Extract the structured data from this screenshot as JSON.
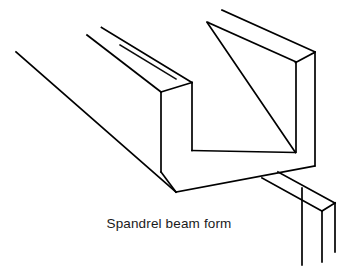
{
  "figure": {
    "title": "Spandrel beam form",
    "caption": "Spandrel beam form",
    "kind": "isometric line drawing",
    "stroke_color": "#000000",
    "background_color": "#ffffff",
    "width": 338,
    "height": 276
  },
  "drawing": {
    "description": "Isometric pictorial of a U-shaped spandrel beam formwork with a bottom ledger strip and a vertical support leg",
    "parts": [
      {
        "id": "outer-back-wall",
        "label": "outer back wall panel"
      },
      {
        "id": "inner-back-wall",
        "label": "inner back wall panel"
      },
      {
        "id": "soffit",
        "label": "soffit / bottom panel"
      },
      {
        "id": "front-wall",
        "label": "front wall panel"
      },
      {
        "id": "end-face",
        "label": "near end cross-section face"
      },
      {
        "id": "ledger-strip",
        "label": "ledger strip"
      },
      {
        "id": "support-leg",
        "label": "vertical support leg"
      }
    ],
    "paths": {
      "long_edge_top_far": "M 222 10 L 315 52",
      "long_edge_top_near": "M 207 22 L 296 62",
      "outer_panel_top_face": "M 222 10 L 315 52 L 296 62 L 207 22 Z",
      "outer_right_vertical": "M 315 52 L 315 166",
      "inner_right_vertical": "M 296 62 L 296 152",
      "far_wall_inner_top": "M 207 22 L 296 62",
      "diag_inner_to_corner": "M 207 23 L 296 152",
      "soffit_far_edge": "M 296 152 L 192 150",
      "soffit_near_edge": "M 176 192 L 315 166",
      "end_face_outer_left": "M 161 92 L 161 172",
      "end_face_inner_right": "M 192 82 L 192 150",
      "end_top_left_edge": "M 161 92 L 192 82",
      "upper_line_a": "M 87 35 L 161 92",
      "upper_line_b": "M 101 28 L 192 82",
      "upper_line_c": "M 119 44 L 175 78",
      "left_long_top": "M 16 52 L 161 134",
      "left_long_bottom": "M 16 52 L 176 192",
      "near_bottom_edge": "M 161 172 L 176 192",
      "ledger_top_near": "M 262 178 L 322 211",
      "ledger_top_far": "M 278 172 L 335 203",
      "ledger_end_cap": "M 322 211 L 335 203",
      "leg_front_vertical": "M 302 188 L 302 265",
      "leg_back_vertical": "M 322 211 L 322 262",
      "leg_right_vertical": "M 335 203 L 335 252"
    }
  },
  "labels": {
    "caption_text": "Spandrel beam form"
  }
}
